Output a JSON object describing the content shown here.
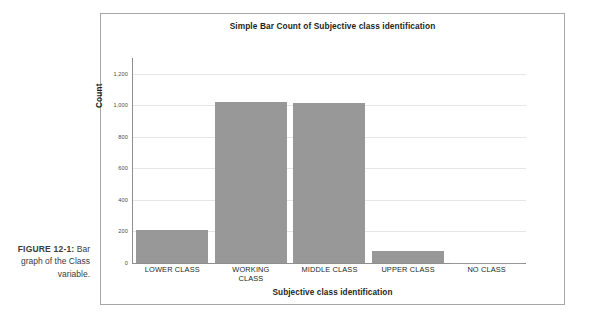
{
  "caption": {
    "number": "FIGURE 12-1:",
    "text": "Bar graph of the Class variable."
  },
  "chart_data": {
    "type": "bar",
    "title": "Simple Bar Count of Subjective class identification",
    "xlabel": "Subjective class identification",
    "ylabel": "Count",
    "categories": [
      "LOWER CLASS",
      "WORKING CLASS",
      "MIDDLE CLASS",
      "UPPER CLASS",
      "NO CLASS"
    ],
    "category_label_lines": [
      [
        "LOWER CLASS"
      ],
      [
        "WORKING",
        "CLASS"
      ],
      [
        "MIDDLE CLASS"
      ],
      [
        "UPPER CLASS"
      ],
      [
        "NO CLASS"
      ]
    ],
    "values": [
      210,
      1020,
      1015,
      78,
      3
    ],
    "ylim": [
      0,
      1300
    ],
    "yticks": [
      0,
      200,
      400,
      600,
      800,
      1000,
      1200
    ],
    "ytick_labels": [
      "0",
      "200",
      "400",
      "600",
      "800",
      "1,000",
      "1,200"
    ],
    "grid": true,
    "legend": false,
    "bar_color": "#989898",
    "grid_color": "#e6e6e6",
    "axis_color": "#8e8e8e",
    "frame_color": "#a7a7a7",
    "background": "#ffffff"
  }
}
